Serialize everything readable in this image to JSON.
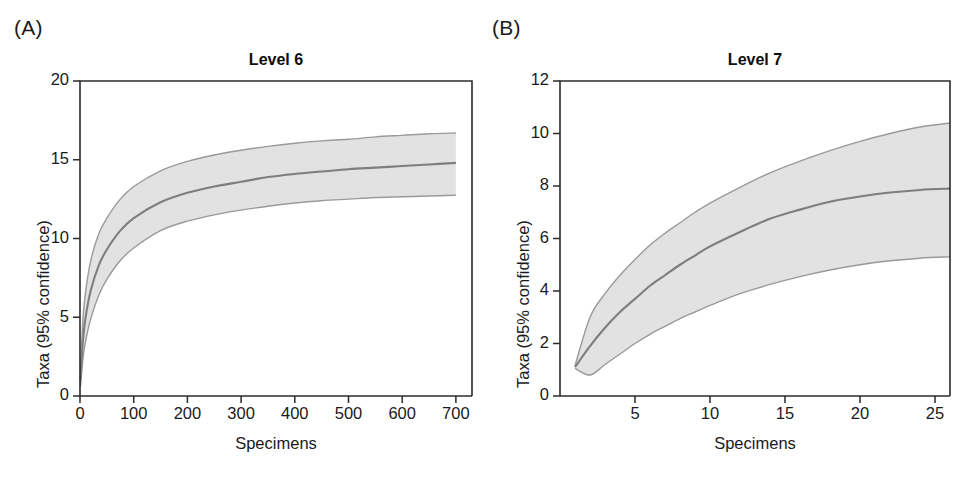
{
  "figure": {
    "panels": [
      {
        "letter": "(A)",
        "title": "Level 6",
        "xlabel": "Specimens",
        "ylabel": "Taxa (95% confidence)"
      },
      {
        "letter": "(B)",
        "title": "Level 7",
        "xlabel": "Specimens",
        "ylabel": "Taxa (95% confidence)"
      }
    ]
  },
  "chart_data": [
    {
      "type": "line",
      "title": "Level 6",
      "panel": "(A)",
      "xlabel": "Specimens",
      "ylabel": "Taxa (95% confidence)",
      "xlim": [
        0,
        730
      ],
      "ylim": [
        0,
        20
      ],
      "xticks": [
        0,
        100,
        200,
        300,
        400,
        500,
        600,
        700
      ],
      "xtick_labels": [
        "0",
        "100",
        "200",
        "300",
        "400",
        "500",
        "600",
        "700"
      ],
      "yticks": [
        0,
        5,
        10,
        15,
        20
      ],
      "ytick_labels": [
        "0",
        "5",
        "10",
        "15",
        "20"
      ],
      "grid": false,
      "legend": "none",
      "x": [
        1,
        5,
        10,
        20,
        35,
        50,
        75,
        100,
        150,
        200,
        250,
        300,
        350,
        400,
        450,
        500,
        550,
        600,
        650,
        700
      ],
      "series": [
        {
          "name": "Mean rarefied taxa",
          "color": "#7e7e7e",
          "values": [
            1.0,
            3.3,
            4.9,
            6.7,
            8.3,
            9.3,
            10.5,
            11.3,
            12.3,
            12.9,
            13.3,
            13.6,
            13.9,
            14.1,
            14.25,
            14.4,
            14.5,
            14.6,
            14.7,
            14.8
          ]
        },
        {
          "name": "Upper 95% confidence limit",
          "color": "#9a9a9a",
          "values": [
            1.4,
            4.6,
            6.5,
            8.6,
            10.3,
            11.3,
            12.5,
            13.3,
            14.3,
            14.9,
            15.3,
            15.6,
            15.85,
            16.05,
            16.2,
            16.3,
            16.45,
            16.55,
            16.65,
            16.7
          ]
        },
        {
          "name": "Lower 95% confidence limit",
          "color": "#9a9a9a",
          "values": [
            0.6,
            2.2,
            3.4,
            4.9,
            6.4,
            7.4,
            8.6,
            9.4,
            10.5,
            11.1,
            11.5,
            11.8,
            12.05,
            12.25,
            12.4,
            12.5,
            12.6,
            12.65,
            12.7,
            12.75
          ]
        }
      ]
    },
    {
      "type": "line",
      "title": "Level 7",
      "panel": "(B)",
      "xlabel": "Specimens",
      "ylabel": "Taxa (95% confidence)",
      "xlim": [
        0,
        26
      ],
      "ylim": [
        0,
        12
      ],
      "xticks": [
        5,
        10,
        15,
        20,
        25
      ],
      "xtick_labels": [
        "5",
        "10",
        "15",
        "20",
        "25"
      ],
      "yticks": [
        0,
        2,
        4,
        6,
        8,
        10,
        12
      ],
      "ytick_labels": [
        "0",
        "2",
        "4",
        "6",
        "8",
        "10",
        "12"
      ],
      "grid": false,
      "legend": "none",
      "x": [
        1,
        2,
        3,
        4,
        5,
        6,
        7,
        8,
        9,
        10,
        12,
        14,
        16,
        18,
        20,
        22,
        24,
        26
      ],
      "series": [
        {
          "name": "Mean rarefied taxa",
          "color": "#7e7e7e",
          "values": [
            1.1,
            1.9,
            2.6,
            3.2,
            3.7,
            4.2,
            4.6,
            5.0,
            5.35,
            5.7,
            6.25,
            6.75,
            7.1,
            7.4,
            7.6,
            7.75,
            7.85,
            7.9
          ]
        },
        {
          "name": "Upper 95% confidence limit",
          "color": "#9a9a9a",
          "values": [
            1.15,
            3.0,
            3.9,
            4.6,
            5.2,
            5.75,
            6.2,
            6.6,
            7.0,
            7.35,
            7.95,
            8.5,
            8.95,
            9.35,
            9.7,
            10.0,
            10.25,
            10.4
          ]
        },
        {
          "name": "Lower 95% confidence limit",
          "color": "#9a9a9a",
          "values": [
            1.05,
            0.8,
            1.2,
            1.6,
            2.0,
            2.35,
            2.65,
            2.95,
            3.2,
            3.45,
            3.9,
            4.25,
            4.55,
            4.8,
            5.0,
            5.15,
            5.25,
            5.3
          ]
        }
      ]
    }
  ]
}
